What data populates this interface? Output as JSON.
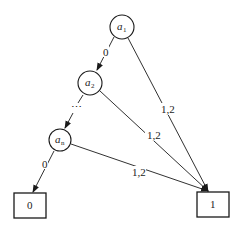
{
  "diagram": {
    "type": "binary-decision-diagram",
    "nodes": [
      {
        "id": "a1",
        "base": "a",
        "sub": "1",
        "shape": "circle",
        "cx": 122,
        "cy": 27,
        "r": 12
      },
      {
        "id": "a2",
        "base": "a",
        "sub": "2",
        "shape": "circle",
        "cx": 90,
        "cy": 83,
        "r": 12
      },
      {
        "id": "an",
        "base": "a",
        "sub": "n",
        "shape": "circle",
        "cx": 60,
        "cy": 140,
        "r": 11
      }
    ],
    "terminals": [
      {
        "id": "t0",
        "label": "0",
        "x": 14,
        "y": 193,
        "w": 32,
        "h": 25
      },
      {
        "id": "t1",
        "label": "1",
        "x": 197,
        "y": 192,
        "w": 32,
        "h": 25
      }
    ],
    "edges": [
      {
        "from": "a1",
        "to": "a2",
        "label": "0"
      },
      {
        "from": "a2",
        "to": "an",
        "label": "...",
        "style": "dotted"
      },
      {
        "from": "an",
        "to": "t0",
        "label": "0"
      },
      {
        "from": "a1",
        "to": "t1",
        "label": "1,2"
      },
      {
        "from": "a2",
        "to": "t1",
        "label": "1,2"
      },
      {
        "from": "an",
        "to": "t1",
        "label": "1,2"
      }
    ],
    "ellipsis": "⋯",
    "stroke_color": "#1a1a1a"
  }
}
